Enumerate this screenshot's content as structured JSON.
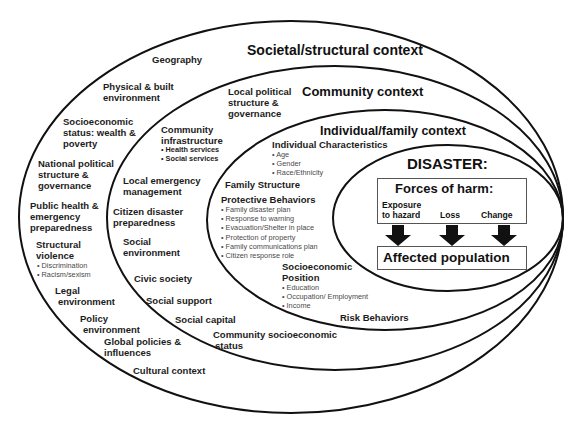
{
  "contexts": {
    "societal": "Societal/structural context",
    "community": "Community context",
    "individual": "Individual/family context",
    "disaster": "DISASTER:"
  },
  "societal_factors": [
    {
      "id": "geography",
      "lines": [
        "Geography"
      ]
    },
    {
      "id": "physical",
      "lines": [
        "Physical & built",
        "environment"
      ]
    },
    {
      "id": "ses",
      "lines": [
        "Socioeconomic",
        "status: wealth &",
        "poverty"
      ]
    },
    {
      "id": "national",
      "lines": [
        "National political",
        "structure &",
        "governance"
      ]
    },
    {
      "id": "public_health",
      "lines": [
        "Public health &",
        "emergency",
        "preparedness"
      ]
    },
    {
      "id": "structural_violence",
      "lines": [
        "Structural",
        "violence"
      ],
      "bullets": [
        "Discrimination",
        "Racism/sexism"
      ]
    },
    {
      "id": "legal",
      "lines": [
        "Legal",
        "environment"
      ]
    },
    {
      "id": "policy",
      "lines": [
        "Policy",
        "environment"
      ]
    },
    {
      "id": "global",
      "lines": [
        "Global policies &",
        "influences"
      ]
    },
    {
      "id": "cultural",
      "lines": [
        "Cultural context"
      ]
    }
  ],
  "community_factors": [
    {
      "id": "local_political",
      "lines": [
        "Local political",
        "structure &",
        "governance"
      ]
    },
    {
      "id": "infrastructure",
      "lines": [
        "Community",
        "infrastructure"
      ],
      "bullets": [
        "Health services",
        "Social services"
      ]
    },
    {
      "id": "local_emergency",
      "lines": [
        "Local emergency",
        "management"
      ]
    },
    {
      "id": "citizen_prep",
      "lines": [
        "Citizen disaster",
        "preparedness"
      ]
    },
    {
      "id": "social_env",
      "lines": [
        "Social",
        "environment"
      ]
    },
    {
      "id": "civic",
      "lines": [
        "Civic society"
      ]
    },
    {
      "id": "social_support",
      "lines": [
        "Social support"
      ]
    },
    {
      "id": "social_capital",
      "lines": [
        "Social capital"
      ]
    },
    {
      "id": "community_ses",
      "lines": [
        "Community socioeconomic",
        "status"
      ]
    }
  ],
  "individual_factors": [
    {
      "id": "characteristics",
      "lines": [
        "Individual Characteristics"
      ],
      "bullets": [
        "Age",
        "Gender",
        "Race/Ethnicity"
      ]
    },
    {
      "id": "family_structure",
      "lines": [
        "Family Structure"
      ]
    },
    {
      "id": "protective",
      "lines": [
        "Protective Behaviors"
      ],
      "bullets": [
        "Family disaster plan",
        "Response to warning",
        "Evacuation/Shelter in place",
        "Protection of property",
        "Family communications plan",
        "Citizen response role"
      ]
    },
    {
      "id": "socioeconomic_position",
      "lines": [
        "Socioeconomic",
        "Position"
      ],
      "bullets": [
        "Education",
        "Occupation/ Employment",
        "Income"
      ]
    },
    {
      "id": "risk",
      "lines": [
        "Risk Behaviors"
      ]
    }
  ],
  "disaster": {
    "forces_title": "Forces of harm:",
    "forces": [
      {
        "id": "exposure",
        "lines": [
          "Exposure",
          "to hazard"
        ]
      },
      {
        "id": "loss",
        "lines": [
          "Loss"
        ]
      },
      {
        "id": "change",
        "lines": [
          "Change"
        ]
      }
    ],
    "outcome": "Affected population"
  },
  "colors": {
    "line": "#111111",
    "text": "#1c1c1c",
    "bullet_text": "#4a4a4a",
    "box_border": "#555555",
    "arrow": "#111111"
  }
}
